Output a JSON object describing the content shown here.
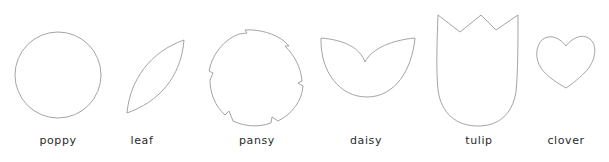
{
  "figure": {
    "stroke_color": "#9a9a9a",
    "text_color": "#2a2a2a",
    "background": "#ffffff"
  },
  "shapes": [
    {
      "name": "poppy",
      "label": "poppy",
      "label_x": 58,
      "form": "circle"
    },
    {
      "name": "leaf",
      "label": "leaf",
      "label_x": 142,
      "form": "leaf"
    },
    {
      "name": "pansy",
      "label": "pansy",
      "label_x": 257,
      "form": "notched-circle"
    },
    {
      "name": "daisy",
      "label": "daisy",
      "label_x": 366,
      "form": "two-petal"
    },
    {
      "name": "tulip",
      "label": "tulip",
      "label_x": 479,
      "form": "tulip"
    },
    {
      "name": "clover",
      "label": "clover",
      "label_x": 566,
      "form": "heart"
    }
  ]
}
